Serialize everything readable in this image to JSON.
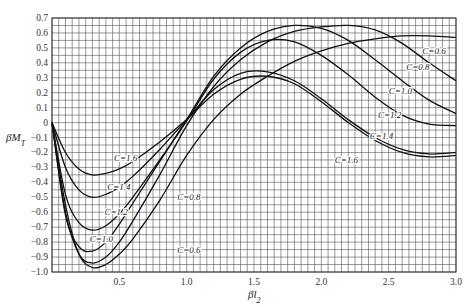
{
  "chart_data": {
    "type": "line",
    "title": "",
    "xlabel": "βl₂",
    "ylabel": "βM_T",
    "xlim": [
      0,
      3.0
    ],
    "ylim": [
      -1.0,
      0.7
    ],
    "grid": true,
    "x_ticks": [
      "0.5",
      "1.0",
      "1.5",
      "2.0",
      "2.5",
      "3.0"
    ],
    "y_ticks": [
      "0.7",
      "0.6",
      "0.5",
      "0.4",
      "0.3",
      "0.2",
      "0.1",
      "0",
      "-0.1",
      "-0.2",
      "-0.3",
      "-0.4",
      "-0.5",
      "-0.6",
      "-0.7",
      "-0.8",
      "-0.9",
      "-1.0"
    ],
    "x": [
      0,
      0.1,
      0.2,
      0.3,
      0.4,
      0.5,
      0.6,
      0.8,
      1.0,
      1.2,
      1.4,
      1.6,
      1.8,
      2.0,
      2.2,
      2.4,
      2.6,
      2.8,
      3.0
    ],
    "series": [
      {
        "name": "C=0.6",
        "label": "C=0.6",
        "values": [
          0,
          -0.55,
          -0.88,
          -0.97,
          -0.95,
          -0.88,
          -0.78,
          -0.52,
          -0.22,
          0.02,
          0.19,
          0.31,
          0.41,
          0.48,
          0.53,
          0.56,
          0.58,
          0.58,
          0.57
        ]
      },
      {
        "name": "C=0.8",
        "label": "C=0.8",
        "values": [
          0,
          -0.6,
          -0.88,
          -0.94,
          -0.9,
          -0.8,
          -0.66,
          -0.35,
          -0.02,
          0.24,
          0.42,
          0.54,
          0.61,
          0.64,
          0.65,
          0.62,
          0.53,
          0.4,
          0.28
        ]
      },
      {
        "name": "C=1.0",
        "label": "C=1.0",
        "values": [
          0,
          -0.62,
          -0.83,
          -0.86,
          -0.8,
          -0.68,
          -0.54,
          -0.26,
          0.02,
          0.31,
          0.5,
          0.61,
          0.65,
          0.63,
          0.55,
          0.42,
          0.28,
          0.15,
          0.06
        ]
      },
      {
        "name": "C=1.2",
        "label": "C=1.2",
        "values": [
          0,
          -0.48,
          -0.67,
          -0.72,
          -0.69,
          -0.61,
          -0.5,
          -0.25,
          0.01,
          0.29,
          0.47,
          0.55,
          0.54,
          0.45,
          0.32,
          0.17,
          0.05,
          -0.01,
          -0.02
        ]
      },
      {
        "name": "C=1.4",
        "label": "C=1.4",
        "values": [
          0,
          -0.3,
          -0.45,
          -0.5,
          -0.48,
          -0.43,
          -0.36,
          -0.18,
          0.02,
          0.22,
          0.33,
          0.34,
          0.28,
          0.16,
          0.02,
          -0.1,
          -0.18,
          -0.21,
          -0.2
        ]
      },
      {
        "name": "C=1.6",
        "label": "C=1.6",
        "values": [
          0,
          -0.2,
          -0.31,
          -0.35,
          -0.34,
          -0.31,
          -0.26,
          -0.13,
          0.02,
          0.19,
          0.29,
          0.31,
          0.26,
          0.14,
          0.0,
          -0.12,
          -0.2,
          -0.23,
          -0.22
        ]
      }
    ],
    "label_positions": [
      {
        "name": "C=0.6",
        "x": 2.75,
        "y": 0.48
      },
      {
        "name": "C=0.8",
        "x": 2.63,
        "y": 0.37
      },
      {
        "name": "C=1.0",
        "x": 2.5,
        "y": 0.21
      },
      {
        "name": "C=1.2",
        "x": 2.42,
        "y": 0.05
      },
      {
        "name": "C=1.4",
        "x": 2.36,
        "y": -0.09
      },
      {
        "name": "C=1.6",
        "x": 2.1,
        "y": -0.25
      },
      {
        "name": "C=1.6b",
        "text": "C=1.6",
        "x": 0.46,
        "y": -0.24
      },
      {
        "name": "C=1.4b",
        "text": "C=1.4",
        "x": 0.41,
        "y": -0.43
      },
      {
        "name": "C=1.2b",
        "text": "C=1.2",
        "x": 0.39,
        "y": -0.6
      },
      {
        "name": "C=1.0b",
        "text": "C=1.0",
        "x": 0.28,
        "y": -0.78
      },
      {
        "name": "C=0.8b",
        "text": "C=0.8",
        "x": 0.93,
        "y": -0.5
      },
      {
        "name": "C=0.6b",
        "text": "C=0.6",
        "x": 0.93,
        "y": -0.85
      }
    ]
  }
}
